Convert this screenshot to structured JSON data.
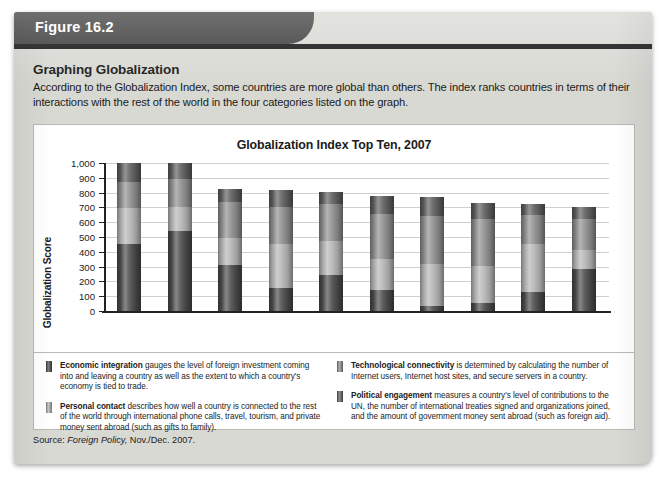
{
  "figure": {
    "tab_label": "Figure 16.2",
    "heading": "Graphing Globalization",
    "description": "According to the Globalization Index, some countries are more global than others. The index ranks countries in terms of their interactions with the rest of the world in the four categories listed on the graph.",
    "source_prefix": "Source: ",
    "source_journal": "Foreign Policy,",
    "source_rest": " Nov./Dec. 2007."
  },
  "legend": {
    "items": [
      {
        "term": "Economic integration",
        "text": " gauges the level of foreign investment coming into and leaving a country as well as the extent to which a country's economy is tied to trade.",
        "color": "#4a4a4a"
      },
      {
        "term": "Personal contact",
        "text": " describes how well a country is connected to the rest of the world through international phone calls, travel, tourism, and private money sent abroad (such as gifts to family).",
        "color": "#b5b5b5"
      },
      {
        "term": "Technological connectivity",
        "text": " is determined by calculating the number of Internet users, Internet host sites, and secure servers in a country.",
        "color": "#8e8e8e"
      },
      {
        "term": "Political engagement",
        "text": " measures a country's level of contributions to the UN, the number of international treaties signed and organizations joined, and the amount of government money sent abroad (such as foreign aid).",
        "color": "#5e5e5e"
      }
    ]
  },
  "chart_data": {
    "type": "bar",
    "stacked": true,
    "title": "Globalization Index Top Ten, 2007",
    "xlabel": "Country",
    "ylabel": "Globalization Score",
    "ylim": [
      0,
      1000
    ],
    "yticks": [
      0,
      100,
      200,
      300,
      400,
      500,
      600,
      700,
      800,
      900,
      1000
    ],
    "ytick_labels": [
      "0",
      "100",
      "200",
      "300",
      "400",
      "500",
      "600",
      "700",
      "800",
      "900",
      "1,000"
    ],
    "grid": true,
    "legend_position": "below-chart",
    "categories": [
      "Singapore",
      "Hong Kong",
      "Netherlands",
      "Switzerland",
      "Ireland",
      "Denmark",
      "United States",
      "Canada",
      "Jordan",
      "Estonia"
    ],
    "series": [
      {
        "name": "Economic integration",
        "color": "#4a4a4a",
        "values": [
          450,
          540,
          310,
          155,
          245,
          140,
          35,
          55,
          130,
          285
        ]
      },
      {
        "name": "Personal contact",
        "color": "#b5b5b5",
        "values": [
          245,
          160,
          185,
          300,
          230,
          210,
          280,
          250,
          320,
          130
        ]
      },
      {
        "name": "Technological connectivity",
        "color": "#8e8e8e",
        "values": [
          175,
          190,
          245,
          250,
          245,
          305,
          330,
          320,
          200,
          210
        ],
        "note": "Singapore segment 695-870"
      },
      {
        "name": "Political engagement",
        "color": "#5e5e5e",
        "values": [
          130,
          110,
          85,
          115,
          85,
          125,
          125,
          105,
          70,
          75
        ]
      }
    ],
    "totals": [
      1000,
      1000,
      825,
      820,
      805,
      780,
      770,
      730,
      720,
      700
    ]
  }
}
